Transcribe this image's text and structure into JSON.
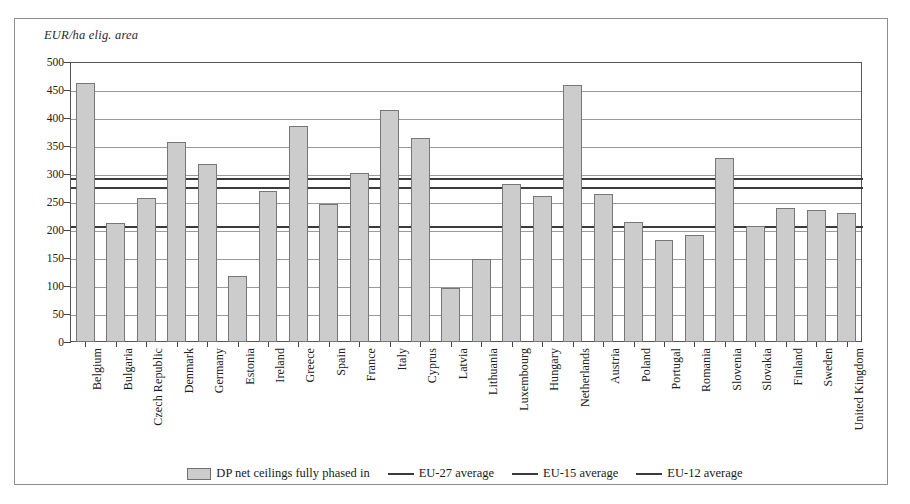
{
  "axis": {
    "unit_label": "EUR/ha elig. area",
    "y_ticks": [
      0,
      50,
      100,
      150,
      200,
      250,
      300,
      350,
      400,
      450,
      500
    ]
  },
  "legend": {
    "bar_label": "DP net ceilings fully phased in",
    "eu27_label": "EU-27 average",
    "eu15_label": "EU-15 average",
    "eu12_label": "EU-12 average"
  },
  "chart_data": {
    "type": "bar",
    "title": "",
    "xlabel": "",
    "ylabel": "EUR/ha elig. area",
    "ylim": [
      0,
      500
    ],
    "ytick_step": 50,
    "grid": true,
    "legend_position": "bottom",
    "categories": [
      "Belgium",
      "Bulgaria",
      "Czech Republic",
      "Denmark",
      "Germany",
      "Estonia",
      "Ireland",
      "Greece",
      "Spain",
      "France",
      "Italy",
      "Cyprus",
      "Latvia",
      "Lithuania",
      "Luxembourg",
      "Hungary",
      "Netherlands",
      "Austria",
      "Poland",
      "Portugal",
      "Romania",
      "Slovenia",
      "Slovakia",
      "Finland",
      "Sweden",
      "United Kingdom"
    ],
    "series": [
      {
        "name": "DP net ceilings fully phased in",
        "values": [
          462,
          212,
          258,
          358,
          318,
          118,
          270,
          385,
          246,
          302,
          414,
          364,
          96,
          148,
          283,
          260,
          459,
          265,
          214,
          182,
          191,
          328,
          208,
          240,
          235,
          231
        ]
      }
    ],
    "reference_lines": [
      {
        "name": "EU-27 average",
        "value": 292
      },
      {
        "name": "EU-15 average",
        "value": 277
      },
      {
        "name": "EU-12 average",
        "value": 208
      }
    ]
  }
}
